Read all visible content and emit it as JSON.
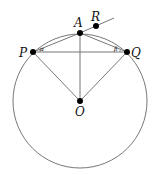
{
  "diagram": {
    "type": "geometry",
    "circle": {
      "center": "O",
      "stroke": "#777777"
    },
    "points": [
      {
        "name": "P",
        "label": "P"
      },
      {
        "name": "A",
        "label": "A"
      },
      {
        "name": "Q",
        "label": "Q"
      },
      {
        "name": "R",
        "label": "R"
      },
      {
        "name": "O",
        "label": "O"
      }
    ],
    "angles": [
      {
        "at": "P",
        "label": "α"
      },
      {
        "at": "Q",
        "label": "β"
      }
    ],
    "segments": [
      "PA",
      "AQ",
      "PQ",
      "AO",
      "PO",
      "QO",
      "AR (ray)"
    ],
    "colors": {
      "line": "#777777",
      "point": "#000000"
    }
  }
}
